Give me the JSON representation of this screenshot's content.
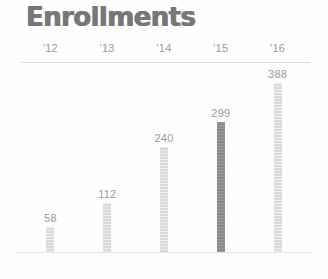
{
  "chart_data": {
    "type": "bar",
    "title": "Enrollments",
    "xlabel": "",
    "ylabel": "",
    "categories": [
      "'12",
      "'13",
      "'14",
      "'15",
      "'16"
    ],
    "values": [
      58,
      112,
      240,
      299,
      388
    ],
    "value_labels": [
      "58",
      "112",
      "240",
      "299",
      "388"
    ],
    "ylim": [
      0,
      388
    ],
    "grid": false,
    "legend": null,
    "highlight_index": 3,
    "colors": {
      "bar": "#d9d9d9",
      "bar_highlight": "#8b8b8b",
      "title": "#777777",
      "label": "#9a9a9a",
      "axis_rule": "#dddddd",
      "baseline": "#e4e4e4",
      "background": "#fefefe"
    }
  }
}
